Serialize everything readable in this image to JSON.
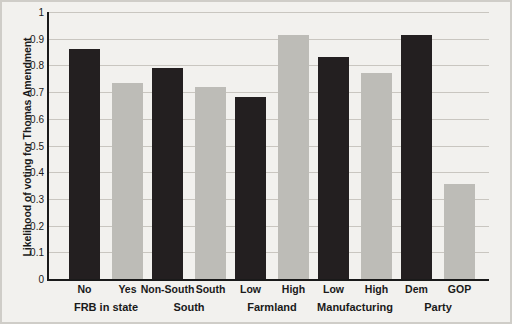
{
  "chart_data": {
    "type": "bar",
    "title": "",
    "xlabel": "",
    "ylabel": "Likelihood of voting for Thomas Amendment",
    "ylim": [
      0,
      1
    ],
    "yticks": [
      "0",
      "0.1",
      "0.2",
      "0.3",
      "0.4",
      "0.5",
      "0.6",
      "0.7",
      "0.8",
      "0.9",
      "1"
    ],
    "grid": true,
    "legend": "none",
    "groups": [
      {
        "name": "FRB in state",
        "categories": [
          "No",
          "Yes"
        ],
        "values": [
          0.86,
          0.735
        ],
        "colors": [
          "#231f20",
          "#bdbcb7"
        ]
      },
      {
        "name": "South",
        "categories": [
          "Non-South",
          "South"
        ],
        "values": [
          0.79,
          0.72
        ],
        "colors": [
          "#231f20",
          "#bdbcb7"
        ]
      },
      {
        "name": "Farmland",
        "categories": [
          "Low",
          "High"
        ],
        "values": [
          0.68,
          0.915
        ],
        "colors": [
          "#231f20",
          "#bdbcb7"
        ]
      },
      {
        "name": "Manufacturing",
        "categories": [
          "Low",
          "High"
        ],
        "values": [
          0.83,
          0.77
        ],
        "colors": [
          "#231f20",
          "#bdbcb7"
        ]
      },
      {
        "name": "Party",
        "categories": [
          "Dem",
          "GOP"
        ],
        "values": [
          0.915,
          0.355
        ],
        "colors": [
          "#231f20",
          "#bdbcb7"
        ]
      }
    ],
    "categories": [
      "No",
      "Yes",
      "Non-South",
      "South",
      "Low",
      "High",
      "Low",
      "High",
      "Dem",
      "GOP"
    ],
    "values": [
      0.86,
      0.735,
      0.79,
      0.72,
      0.68,
      0.915,
      0.83,
      0.77,
      0.915,
      0.355
    ],
    "colors": {
      "dark": "#231f20",
      "light": "#bdbcb7",
      "background": "#f2f1ee",
      "axis": "#1a1a1a",
      "grid": "#c9c6c0"
    }
  }
}
